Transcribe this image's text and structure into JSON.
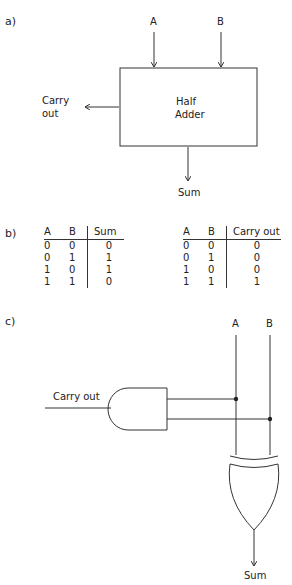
{
  "parts": {
    "a": "a)",
    "b": "b)",
    "c": "c)"
  },
  "block_diagram": {
    "inputs": [
      "A",
      "B"
    ],
    "block_label_line1": "Half",
    "block_label_line2": "Adder",
    "carry_label_line1": "Carry",
    "carry_label_line2": "out",
    "sum_label": "Sum"
  },
  "truth_tables": [
    {
      "headers": [
        "A",
        "B",
        "Sum"
      ],
      "rows": [
        [
          "0",
          "0",
          "0"
        ],
        [
          "0",
          "1",
          "1"
        ],
        [
          "1",
          "0",
          "1"
        ],
        [
          "1",
          "1",
          "0"
        ]
      ]
    },
    {
      "headers": [
        "A",
        "B",
        "Carry out"
      ],
      "rows": [
        [
          "0",
          "0",
          "0"
        ],
        [
          "0",
          "1",
          "0"
        ],
        [
          "1",
          "0",
          "0"
        ],
        [
          "1",
          "1",
          "1"
        ]
      ]
    }
  ],
  "circuit": {
    "input_a": "A",
    "input_b": "B",
    "carry_label": "Carry out",
    "sum_label": "Sum",
    "gates": [
      "AND",
      "XOR"
    ]
  },
  "colors": {
    "line": "#333333",
    "text": "#222222"
  }
}
